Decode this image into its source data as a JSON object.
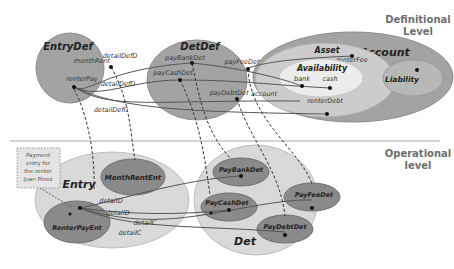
{
  "levels": {
    "definitional_line1": "Definitional",
    "definitional_line2": "Level",
    "operational_line1": "Operational",
    "operational_line2": "level"
  },
  "definitional": {
    "entry_def": {
      "title": "EntryDef",
      "attrs": [
        "monthRent",
        "renterPay"
      ]
    },
    "det_def": {
      "title": "DetDef",
      "attrs": [
        "payBankDet",
        "payCashDet",
        "payFeeDet",
        "payDebtDet"
      ]
    },
    "account": {
      "title": "Account",
      "asset": {
        "title": "Asset",
        "attrs": [
          "renterFee",
          "renterDebt"
        ]
      },
      "availability": {
        "title": "Availability",
        "attrs": [
          "bank",
          "cash"
        ]
      },
      "liability": {
        "title": "Liability"
      }
    },
    "relations": [
      "detailDefD",
      "detailDefD",
      "detailDefC",
      "account"
    ]
  },
  "operational": {
    "entry": {
      "title": "Entry",
      "instances": [
        "MonthRentEnt",
        "RenterPayEnt"
      ]
    },
    "det": {
      "title": "Det",
      "instances": [
        "PayBankDet",
        "PayCashDet",
        "PayFeeDet",
        "PayDebtDet"
      ]
    },
    "relations": [
      "detailD",
      "detailD",
      "detailC",
      "detailC"
    ]
  },
  "note": {
    "line1": "Payment",
    "line2": "entry for",
    "line3": "the renter",
    "line4": "Juan Pérez"
  },
  "colors": {
    "dark_ellipse": "#a3a3a3",
    "light_ellipse": "#d9d9d9",
    "lighter_ellipse": "#ececec",
    "inner_dark": "#8a8a8a",
    "line": "#555555",
    "divider": "#bdbdbd"
  }
}
